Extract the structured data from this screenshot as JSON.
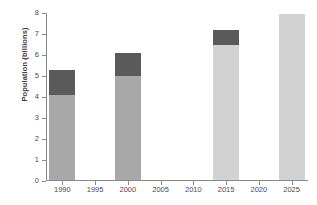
{
  "chart_data": {
    "type": "bar",
    "stacked": true,
    "title": "",
    "xlabel": "",
    "ylabel": "Population (billions)",
    "ylim": [
      0,
      8
    ],
    "yticks": [
      0,
      1,
      2,
      3,
      4,
      5,
      6,
      7,
      8
    ],
    "ytick_labels": [
      "0",
      "1",
      "2",
      "3",
      "4",
      "5",
      "6",
      "7",
      "8"
    ],
    "xlim": [
      1987.5,
      2027.5
    ],
    "xticks": [
      1990,
      1995,
      2000,
      2005,
      2010,
      2015,
      2020,
      2025
    ],
    "xtick_labels": [
      "1990",
      "1995",
      "2000",
      "2005",
      "2010",
      "2015",
      "2020",
      "2025"
    ],
    "grid": false,
    "legend": "none",
    "categories": [
      "1990",
      "2000",
      "2015",
      "2025"
    ],
    "series": [
      {
        "name": "base",
        "values": [
          4.05,
          4.95,
          6.45,
          7.9
        ]
      },
      {
        "name": "top",
        "values": [
          1.2,
          1.1,
          0.7,
          0.0
        ]
      }
    ],
    "totals": [
      5.25,
      6.05,
      7.15,
      7.9
    ],
    "bars": [
      {
        "year": "1990",
        "x": 1990,
        "total": 5.25,
        "base_value": 4.05,
        "top_value": 1.2,
        "base_color": "#a8a8a8",
        "top_color": "#5a5a5a"
      },
      {
        "year": "2000",
        "x": 2000,
        "total": 6.05,
        "base_value": 4.95,
        "top_value": 1.1,
        "base_color": "#a8a8a8",
        "top_color": "#5a5a5a"
      },
      {
        "year": "2015",
        "x": 2015,
        "total": 7.15,
        "base_value": 6.45,
        "top_value": 0.7,
        "base_color": "#d2d2d2",
        "top_color": "#5a5a5a"
      },
      {
        "year": "2025",
        "x": 2025,
        "total": 7.9,
        "base_value": 7.9,
        "top_value": 0.0,
        "base_color": "#d2d2d2",
        "top_color": "#5a5a5a"
      }
    ],
    "colors": {
      "axis": "#8a8a8a",
      "tick_text": "#4a4a4a",
      "label_text": "#3b3b3b",
      "background": "#ffffff",
      "dark_segment": "#5a5a5a",
      "mid_segment": "#a8a8a8",
      "light_segment": "#d2d2d2"
    }
  }
}
